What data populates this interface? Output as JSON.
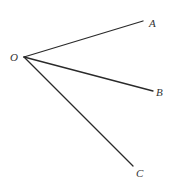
{
  "diagram": {
    "title": "",
    "origin": {
      "label": "O",
      "x": 24,
      "y": 57,
      "label_x": 10,
      "label_y": 61
    },
    "rays": [
      {
        "label": "A",
        "x": 143,
        "y": 21,
        "label_x": 149,
        "label_y": 27
      },
      {
        "label": "B",
        "x": 153,
        "y": 91,
        "label_x": 156,
        "label_y": 96
      },
      {
        "label": "C",
        "x": 133,
        "y": 166,
        "label_x": 136,
        "label_y": 177
      }
    ],
    "line_color": "#2a2a2a",
    "label_color": "#333333"
  }
}
